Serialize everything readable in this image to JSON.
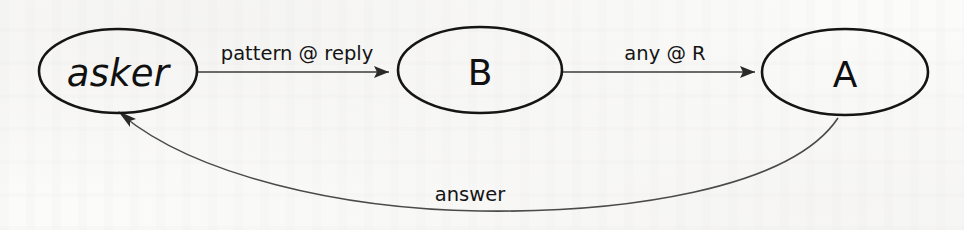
{
  "figure": {
    "kind": "state-transition-diagram",
    "background_color": "#fbfbfa",
    "stroke_color": "#151515",
    "edge_color": "#3b3b3b",
    "text_color": "#101010"
  },
  "nodes": [
    {
      "id": "asker",
      "label": "asker",
      "style": "italic",
      "cx": 118,
      "cy": 71,
      "rx": 79,
      "ry": 42
    },
    {
      "id": "B",
      "label": "B",
      "style": "plain",
      "cx": 480,
      "cy": 70,
      "rx": 82,
      "ry": 43
    },
    {
      "id": "A",
      "label": "A",
      "style": "plain",
      "cx": 845,
      "cy": 72,
      "rx": 83,
      "ry": 43
    }
  ],
  "edges": [
    {
      "id": "asker-to-b",
      "from": "asker",
      "to": "B",
      "label": "pattern @ reply",
      "label_x": 297,
      "label_y": 60,
      "kind": "straight"
    },
    {
      "id": "b-to-a",
      "from": "B",
      "to": "A",
      "label": "any @ R",
      "label_x": 665,
      "label_y": 60,
      "kind": "straight"
    },
    {
      "id": "a-to-asker",
      "from": "A",
      "to": "asker",
      "label": "answer",
      "label_x": 470,
      "label_y": 201,
      "kind": "curved"
    }
  ]
}
